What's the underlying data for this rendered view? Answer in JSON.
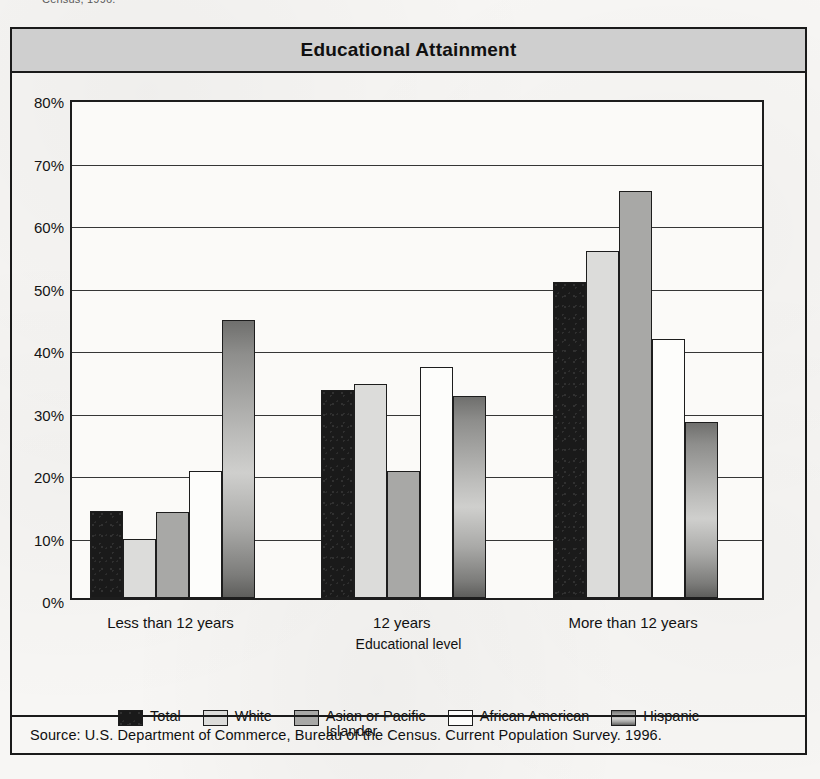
{
  "page": {
    "top_fragment": "Census, 1996."
  },
  "title": "Educational Attainment",
  "source": "Source:  U.S. Department of Commerce, Bureau of the Census. Current Population Survey. 1996.",
  "legend": {
    "entries": [
      {
        "label": "Total",
        "swatch": "black-swatch",
        "key": "total"
      },
      {
        "label": "White",
        "swatch": "light-gray-swatch",
        "key": "white"
      },
      {
        "label": "Asian or Pacific\nIslander",
        "swatch": "medium-gray-swatch",
        "key": "asian"
      },
      {
        "label": "African American",
        "swatch": "white-swatch",
        "key": "african"
      },
      {
        "label": "Hispanic",
        "swatch": "gradient-gray-swatch",
        "key": "hispanic"
      }
    ]
  },
  "chart_data": {
    "type": "bar",
    "title": "Educational Attainment",
    "xlabel": "Educational level",
    "ylabel": "",
    "ylim": [
      0,
      80
    ],
    "ytick_step": 10,
    "ytick_labels": [
      "0%",
      "10%",
      "20%",
      "30%",
      "40%",
      "50%",
      "60%",
      "70%",
      "80%"
    ],
    "grid": true,
    "legend_position": "bottom",
    "value_unit": "percent",
    "categories": [
      "Less than 12 years",
      "12 years",
      "More than 12 years"
    ],
    "series": [
      {
        "name": "Total",
        "values": [
          14.0,
          33.3,
          50.5
        ]
      },
      {
        "name": "White",
        "values": [
          9.5,
          34.3,
          55.6
        ]
      },
      {
        "name": "Asian or Pacific Islander",
        "values": [
          13.8,
          20.3,
          65.2
        ]
      },
      {
        "name": "African American",
        "values": [
          20.3,
          37.0,
          41.4
        ]
      },
      {
        "name": "Hispanic",
        "values": [
          44.5,
          32.3,
          28.2
        ]
      }
    ]
  },
  "colors": {
    "title_band": "#cfcfcf",
    "frame": "#1a1a1a",
    "total": "#1a1a1a",
    "white": "#dcdcda",
    "asian": "#a8a8a6",
    "african": "#fdfdfb",
    "hispanic": "#a9a9a7",
    "paper": "#f7f6f4"
  }
}
